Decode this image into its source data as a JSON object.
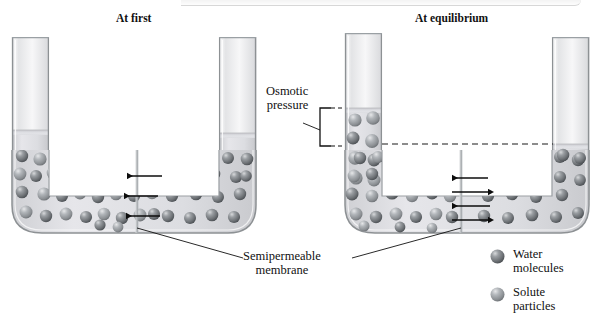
{
  "figure": {
    "kind": "osmosis-u-tube-diagram",
    "panels": [
      {
        "id": "at-first",
        "title": "At first",
        "description": "U-tube with equal liquid levels, net water flow toward solute side",
        "arrows": [
          {
            "direction": "left",
            "y": 176
          },
          {
            "direction": "left",
            "y": 196
          },
          {
            "direction": "left",
            "y": 216
          }
        ]
      },
      {
        "id": "at-equilibrium",
        "title": "At equilibrium",
        "description": "U-tube with raised solute-side column, balanced two-way water flow",
        "arrows": [
          {
            "direction": "left",
            "y": 178
          },
          {
            "direction": "right",
            "y": 192
          },
          {
            "direction": "left",
            "y": 206
          },
          {
            "direction": "right",
            "y": 220
          }
        ]
      }
    ]
  },
  "labels": {
    "osmotic_pressure": "Osmotic\npressure",
    "osmotic_pressure_line1": "Osmotic",
    "osmotic_pressure_line2": "pressure",
    "semipermeable_membrane_line1": "Semipermeable",
    "semipermeable_membrane_line2": "membrane"
  },
  "legend": {
    "items": [
      {
        "icon": "sphere-dark-icon",
        "line1": "Water",
        "line2": "molecules",
        "color": "#6f7377"
      },
      {
        "icon": "sphere-light-icon",
        "line1": "Solute",
        "line2": "particles",
        "color": "#8c9094"
      }
    ]
  },
  "colors": {
    "glass": "#e9eaec",
    "glass_edge": "#8f9396",
    "liquid": "#d9dade",
    "water_sphere": "#6f7377",
    "solute_sphere": "#8d9195",
    "ink": "#111111",
    "dashed": "#222222"
  }
}
